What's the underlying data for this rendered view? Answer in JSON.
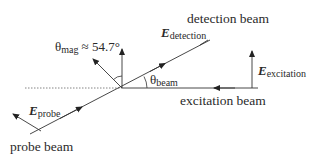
{
  "diagram": {
    "labels": {
      "detection_beam": "detection beam",
      "excitation_beam": "excitation beam",
      "probe_beam": "probe beam",
      "e_detection": {
        "symbol": "E",
        "subscript": "detection"
      },
      "e_excitation": {
        "symbol": "E",
        "subscript": "excitation"
      },
      "e_probe": {
        "symbol": "E",
        "subscript": "probe"
      },
      "theta_mag": {
        "symbol": "θ",
        "subscript": "mag",
        "relation": "≈ 54.7°"
      },
      "theta_beam": {
        "symbol": "θ",
        "subscript": "beam"
      }
    },
    "colors": {
      "line": "#333333",
      "text": "#2a2a2a",
      "background": "#ffffff"
    }
  }
}
